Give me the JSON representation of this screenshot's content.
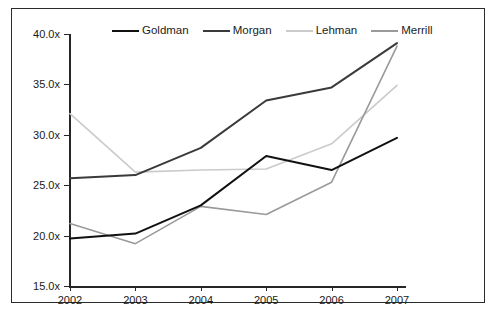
{
  "chart_data": {
    "type": "line",
    "title": "",
    "subtitle": "",
    "xlabel": "",
    "ylabel": "",
    "categories": [
      "2002",
      "2003",
      "2004",
      "2005",
      "2006",
      "2007"
    ],
    "x": [
      2002,
      2003,
      2004,
      2005,
      2006,
      2007
    ],
    "xlim": [
      2002,
      2007
    ],
    "ylim": [
      15.0,
      40.0
    ],
    "y_ticks": [
      15.0,
      20.0,
      25.0,
      30.0,
      35.0,
      40.0
    ],
    "y_tick_labels": [
      "15.0x",
      "20.0x",
      "25.0x",
      "30.0x",
      "35.0x",
      "40.0x"
    ],
    "x_tick_labels": [
      "2002",
      "2003",
      "2004",
      "2005",
      "2006",
      "2007"
    ],
    "grid": false,
    "legend_position": "top-center",
    "value_suffix": "x",
    "series": [
      {
        "name": "Goldman",
        "color": "#111111",
        "values": [
          19.8,
          20.3,
          23.1,
          28.0,
          26.6,
          29.8
        ]
      },
      {
        "name": "Morgan",
        "color": "#3a3a3a",
        "values": [
          25.8,
          26.1,
          28.8,
          33.5,
          34.8,
          39.2
        ]
      },
      {
        "name": "Lehman",
        "color": "#cbcbcb",
        "values": [
          32.2,
          26.4,
          26.6,
          26.7,
          29.2,
          35.0
        ]
      },
      {
        "name": "Merrill",
        "color": "#9a9a9a",
        "values": [
          21.3,
          19.3,
          23.0,
          22.2,
          25.4,
          38.9
        ]
      }
    ]
  },
  "legend": {
    "entries": [
      {
        "label": "Goldman",
        "color": "#111111"
      },
      {
        "label": "Morgan",
        "color": "#3a3a3a"
      },
      {
        "label": "Lehman",
        "color": "#cbcbcb"
      },
      {
        "label": "Merrill",
        "color": "#9a9a9a"
      }
    ]
  },
  "axes": {
    "y_labels": [
      "40.0x",
      "35.0x",
      "30.0x",
      "25.0x",
      "20.0x",
      "15.0x"
    ],
    "x_labels": [
      "2002",
      "2003",
      "2004",
      "2005",
      "2006",
      "2007"
    ]
  }
}
